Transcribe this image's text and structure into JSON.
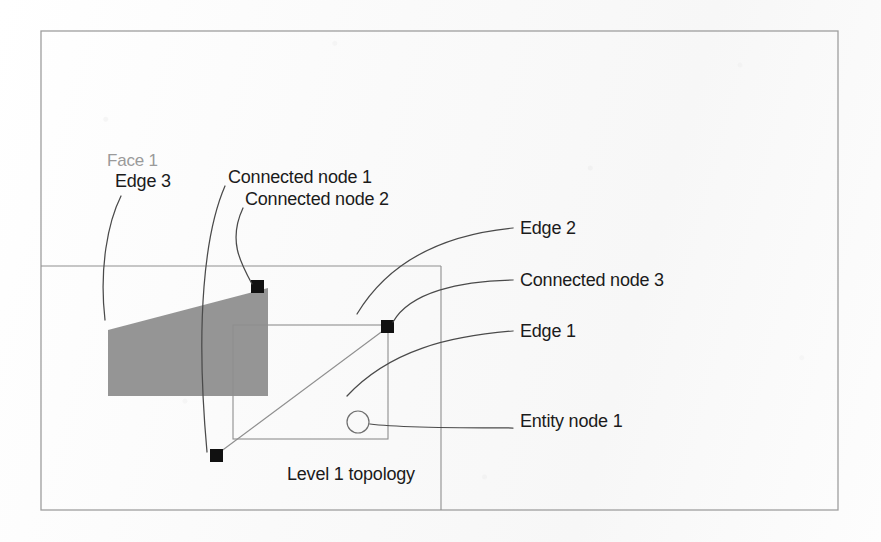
{
  "figure": {
    "caption": "Level 1 topology",
    "colors": {
      "face_fill": "#8c8c8c",
      "node_fill": "#111111",
      "line": "#555555",
      "thin_line": "#888888",
      "face_label": "#9a9a9a",
      "text": "#1b1b1b",
      "background": "#fbfbfb"
    },
    "labels": [
      {
        "id": "face-1",
        "text": "Face 1",
        "x": 107,
        "y": 160,
        "gray": true
      },
      {
        "id": "edge-3",
        "text": "Edge 3",
        "x": 115,
        "y": 180,
        "gray": false
      },
      {
        "id": "connected-node-1",
        "text": "Connected node 1",
        "x": 228,
        "y": 176,
        "gray": false
      },
      {
        "id": "connected-node-2",
        "text": "Connected node 2",
        "x": 245,
        "y": 198,
        "gray": false
      },
      {
        "id": "edge-2",
        "text": "Edge 2",
        "x": 520,
        "y": 227,
        "gray": false
      },
      {
        "id": "connected-node-3",
        "text": "Connected node 3",
        "x": 520,
        "y": 279,
        "gray": false
      },
      {
        "id": "edge-1",
        "text": "Edge 1",
        "x": 520,
        "y": 330,
        "gray": false
      },
      {
        "id": "entity-node-1",
        "text": "Entity node 1",
        "x": 520,
        "y": 420,
        "gray": false
      }
    ],
    "caption_position": {
      "x": 287,
      "y": 473
    },
    "shapes": {
      "outer_frame": {
        "x": 41,
        "y": 31,
        "width": 797,
        "height": 479
      },
      "topology_rect": {
        "x": 41,
        "y": 266,
        "width": 400,
        "height": 244
      },
      "inner_rect": {
        "x": 233,
        "y": 325,
        "width": 155,
        "height": 114
      },
      "face_polygon": "108,330 268,288 268,396 108,396",
      "entity_circle": {
        "cx": 358,
        "cy": 422,
        "r": 11
      },
      "nodes": [
        {
          "id": "connected-node-1-marker",
          "x": 251,
          "y": 280,
          "size": 13
        },
        {
          "id": "connected-node-3-marker",
          "x": 381,
          "y": 320,
          "size": 13
        },
        {
          "id": "connected-node-2-marker",
          "x": 210,
          "y": 449,
          "size": 13
        }
      ],
      "edges": [
        {
          "id": "edge-1-line",
          "from": "216,455",
          "to": "388,327"
        }
      ],
      "leaders": [
        {
          "id": "leader-edge-3",
          "d": "M 121 196 C 108 222, 99 268, 105 320"
        },
        {
          "id": "leader-connected-node-1",
          "d": "M 225 186 C 205 232, 195 320, 207 452"
        },
        {
          "id": "leader-connected-node-2",
          "d": "M 243 208 C 228 240, 240 262, 252 284"
        },
        {
          "id": "leader-edge-2",
          "d": "M 513 228 C 450 234, 392 256, 357 314"
        },
        {
          "id": "leader-connected-node-3",
          "d": "M 513 280 C 460 281, 410 292, 393 322"
        },
        {
          "id": "leader-edge-1",
          "d": "M 513 331 C 450 336, 390 350, 347 396"
        },
        {
          "id": "leader-entity-node-1",
          "d": "M 513 428 C 460 428, 400 428, 370 424"
        }
      ]
    }
  }
}
